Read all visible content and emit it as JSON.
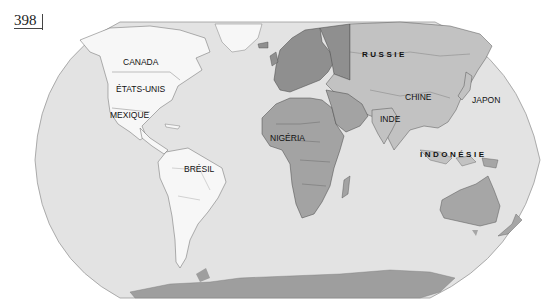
{
  "page_number": "398",
  "map": {
    "projection": "Robinson (world)",
    "colors": {
      "ocean": "#e3e3e3",
      "americas": "#f7f7f7",
      "europe_russia_west": "#8f8f8f",
      "europe_other": "#9a9a9a",
      "asia": "#c2c2c2",
      "africa_middle_east": "#a3a3a3",
      "oceania": "#a6a6a6",
      "antarctica": "#9e9e9e",
      "border": "#555555"
    },
    "labels": {
      "canada": "CANADA",
      "usa": "ÉTATS-UNIS",
      "mexico": "MEXIQUE",
      "brazil": "BRÉSIL",
      "nigeria": "NIGÉRIA",
      "russia": "RUSSIE",
      "china": "CHINE",
      "india": "INDE",
      "japan": "JAPON",
      "indonesia": "INDONÉSIE"
    }
  }
}
